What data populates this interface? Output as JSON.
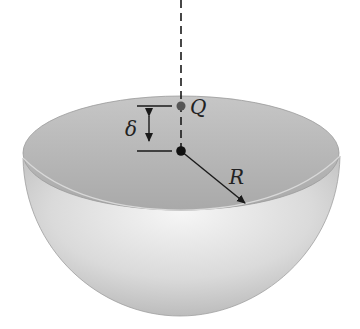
{
  "diagram": {
    "labels": {
      "point_q": "Q",
      "delta": "δ",
      "radius": "R"
    },
    "colors": {
      "line": "#1a1a1a",
      "q_point": "#555555",
      "center_point": "#111111",
      "bowl_inner": "#b8b8b8",
      "bowl_outer_light": "#f2f2f2",
      "bowl_outer_dark": "#bdbdbd"
    }
  }
}
